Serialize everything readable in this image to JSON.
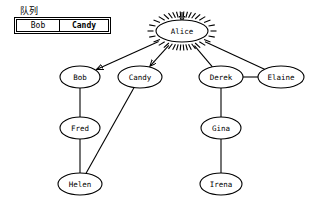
{
  "queue": {
    "label": "队列",
    "columns": [
      "Bob",
      "Candy"
    ],
    "items": [
      {
        "name": "Bob",
        "bold": false
      },
      {
        "name": "Candy",
        "bold": true
      }
    ]
  },
  "graph": {
    "type": "bfs-traversal-tree",
    "nodes": [
      {
        "id": "alice",
        "label": "Alice",
        "cx": 182,
        "cy": 31,
        "rx": 26,
        "ry": 11,
        "highlight": true
      },
      {
        "id": "bob",
        "label": "Bob",
        "cx": 80,
        "cy": 77,
        "rx": 20,
        "ry": 11,
        "highlight": false
      },
      {
        "id": "candy",
        "label": "Candy",
        "cx": 140,
        "cy": 77,
        "rx": 22,
        "ry": 11,
        "highlight": false
      },
      {
        "id": "derek",
        "label": "Derek",
        "cx": 221,
        "cy": 77,
        "rx": 22,
        "ry": 11,
        "highlight": false
      },
      {
        "id": "elaine",
        "label": "Elaine",
        "cx": 281,
        "cy": 77,
        "rx": 23,
        "ry": 11,
        "highlight": false
      },
      {
        "id": "fred",
        "label": "Fred",
        "cx": 80,
        "cy": 128,
        "rx": 20,
        "ry": 11,
        "highlight": false
      },
      {
        "id": "gina",
        "label": "Gina",
        "cx": 221,
        "cy": 128,
        "rx": 20,
        "ry": 11,
        "highlight": false
      },
      {
        "id": "helen",
        "label": "Helen",
        "cx": 80,
        "cy": 184,
        "rx": 22,
        "ry": 11,
        "highlight": false
      },
      {
        "id": "irena",
        "label": "Irena",
        "cx": 221,
        "cy": 184,
        "rx": 21,
        "ry": 11,
        "highlight": false
      }
    ],
    "edges": [
      {
        "from": "alice",
        "to": "bob",
        "arrow": true,
        "kind": "tree"
      },
      {
        "from": "alice",
        "to": "candy",
        "arrow": true,
        "kind": "tree"
      },
      {
        "from": "alice",
        "to": "derek",
        "arrow": false,
        "kind": "plain"
      },
      {
        "from": "alice",
        "to": "elaine",
        "arrow": false,
        "kind": "plain"
      },
      {
        "from": "derek",
        "to": "elaine",
        "arrow": false,
        "kind": "plain"
      },
      {
        "from": "bob",
        "to": "fred",
        "arrow": false,
        "kind": "plain"
      },
      {
        "from": "fred",
        "to": "helen",
        "arrow": false,
        "kind": "plain"
      },
      {
        "from": "helen",
        "to": "candy",
        "arrow": false,
        "kind": "plain"
      },
      {
        "from": "derek",
        "to": "gina",
        "arrow": false,
        "kind": "plain"
      },
      {
        "from": "gina",
        "to": "irena",
        "arrow": false,
        "kind": "plain"
      }
    ],
    "current_node": "alice",
    "incoming_arrow_node": "alice"
  },
  "colors": {
    "stroke": "#000000",
    "background": "#ffffff",
    "text": "#000000"
  }
}
